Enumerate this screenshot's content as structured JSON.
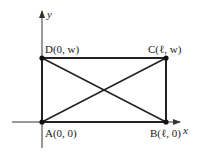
{
  "diagram": {
    "type": "rectangle-with-diagonals-on-coordinate-axes",
    "axes": {
      "x_label": "x",
      "y_label": "y"
    },
    "points": [
      {
        "id": "A",
        "label": "A(0, 0)",
        "coords": [
          0,
          0
        ]
      },
      {
        "id": "B",
        "label": "B(ℓ, 0)",
        "coords": [
          "ℓ",
          0
        ]
      },
      {
        "id": "C",
        "label": "C(ℓ, w)",
        "coords": [
          "ℓ",
          "w"
        ]
      },
      {
        "id": "D",
        "label": "D(0, w)",
        "coords": [
          0,
          "w"
        ]
      }
    ],
    "edges": [
      "AB",
      "BC",
      "CD",
      "DA"
    ],
    "diagonals": [
      "AC",
      "BD"
    ],
    "colors": {
      "line": "#222222",
      "axis": "#333333",
      "background": "#ffffff"
    }
  }
}
